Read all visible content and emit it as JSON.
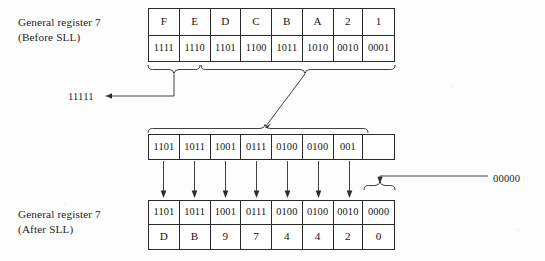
{
  "diagram": {
    "background_color": "#fdfdfd",
    "line_color": "#2b2b2b"
  },
  "labels": {
    "before": {
      "line1": "General register 7",
      "line2": "(Before SLL)"
    },
    "after": {
      "line1": "General register 7",
      "line2": "(After SLL)"
    },
    "shifted_out": "11111",
    "shifted_in": "00000"
  },
  "registers": {
    "before": {
      "name": "before-sll-register",
      "hex_digits": [
        "F",
        "E",
        "D",
        "C",
        "B",
        "A",
        "2",
        "1"
      ],
      "binary_nibbles": [
        "1111",
        "1110",
        "1101",
        "1100",
        "1011",
        "1010",
        "0010",
        "0001"
      ]
    },
    "intermediate": {
      "name": "intermediate-shifted-register",
      "cells": [
        "1101",
        "1011",
        "1001",
        "0111",
        "0100",
        "0100",
        "001",
        ""
      ]
    },
    "after": {
      "name": "after-sll-register",
      "binary_nibbles": [
        "1101",
        "1011",
        "1001",
        "0111",
        "0100",
        "0100",
        "0010",
        "0000"
      ],
      "hex_digits": [
        "D",
        "B",
        "9",
        "7",
        "4",
        "4",
        "2",
        "0"
      ]
    }
  },
  "annotations": {
    "brace_shifted_out_label": "11111",
    "brace_retained_label": "",
    "brace_zero_fill_label": "00000"
  }
}
